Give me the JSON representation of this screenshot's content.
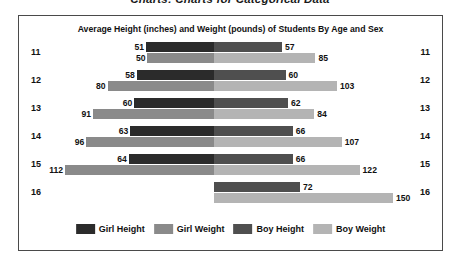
{
  "top_heading": "Charts: Charts for Categorical Data",
  "colors": {
    "girl_height": "#2b2b2b",
    "girl_weight": "#8a8a8a",
    "boy_height": "#4f4f4f",
    "boy_weight": "#b4b4b4",
    "frame_border": "#4a4a4a",
    "text": "#111111",
    "background": "#ffffff"
  },
  "chart_data": {
    "type": "bar",
    "title": "Average Height (inches) and Weight (pounds) of Students By Age and Sex",
    "subtype": "diverging-population-pyramid",
    "xlabel": "",
    "ylabel": "Age",
    "grid": false,
    "legend_position": "bottom",
    "categories": [
      "11",
      "12",
      "13",
      "14",
      "15",
      "16"
    ],
    "left_axis_ticks": [
      "11",
      "12",
      "13",
      "14",
      "15",
      "16"
    ],
    "right_axis_ticks": [
      "11",
      "12",
      "13",
      "14",
      "15",
      "16"
    ],
    "series": [
      {
        "name": "Girl Height",
        "side": "left",
        "unit": "inches",
        "color": "#2b2b2b",
        "values": [
          51,
          58,
          60,
          63,
          64,
          null
        ]
      },
      {
        "name": "Girl Weight",
        "side": "left",
        "unit": "pounds",
        "color": "#8a8a8a",
        "values": [
          50,
          80,
          91,
          96,
          112,
          null
        ]
      },
      {
        "name": "Boy Height",
        "side": "right",
        "unit": "inches",
        "color": "#4f4f4f",
        "values": [
          57,
          60,
          62,
          66,
          66,
          72
        ]
      },
      {
        "name": "Boy Weight",
        "side": "right",
        "unit": "pounds",
        "color": "#b4b4b4",
        "values": [
          85,
          103,
          84,
          107,
          122,
          150
        ]
      }
    ],
    "rows": [
      {
        "age": "11",
        "girl_height": 51,
        "girl_height_label": "51",
        "boy_height": 57,
        "boy_height_label": "57",
        "girl_weight": 50,
        "girl_weight_label": "50",
        "boy_weight": 85,
        "boy_weight_label": "85"
      },
      {
        "age": "12",
        "girl_height": 58,
        "girl_height_label": "58",
        "boy_height": 60,
        "boy_height_label": "60",
        "girl_weight": 80,
        "girl_weight_label": "80",
        "boy_weight": 103,
        "boy_weight_label": "103"
      },
      {
        "age": "13",
        "girl_height": 60,
        "girl_height_label": "60",
        "boy_height": 62,
        "boy_height_label": "62",
        "girl_weight": 91,
        "girl_weight_label": "91",
        "boy_weight": 84,
        "boy_weight_label": "84"
      },
      {
        "age": "14",
        "girl_height": 63,
        "girl_height_label": "63",
        "boy_height": 66,
        "boy_height_label": "66",
        "girl_weight": 96,
        "girl_weight_label": "96",
        "boy_weight": 107,
        "boy_weight_label": "107"
      },
      {
        "age": "15",
        "girl_height": 64,
        "girl_height_label": "64",
        "boy_height": 66,
        "boy_height_label": "66",
        "girl_weight": 112,
        "girl_weight_label": "112",
        "boy_weight": 122,
        "boy_weight_label": "122"
      },
      {
        "age": "16",
        "girl_height": 0,
        "girl_height_label": "",
        "boy_height": 72,
        "boy_height_label": "72",
        "girl_weight": 0,
        "girl_weight_label": "",
        "boy_weight": 150,
        "boy_weight_label": "150"
      }
    ],
    "legend": [
      {
        "label": "Girl Height",
        "color": "#2b2b2b"
      },
      {
        "label": "Girl Weight",
        "color": "#8a8a8a"
      },
      {
        "label": "Boy Height",
        "color": "#4f4f4f"
      },
      {
        "label": "Boy Weight",
        "color": "#b4b4b4"
      }
    ]
  }
}
